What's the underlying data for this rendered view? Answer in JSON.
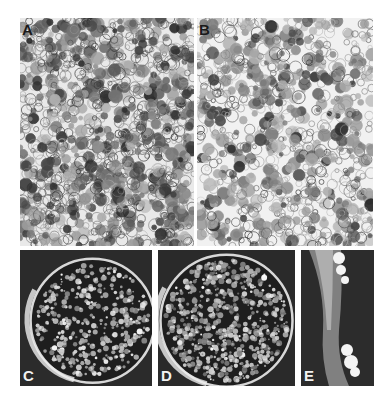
{
  "figure": {
    "panels": [
      {
        "id": "A",
        "label": "A",
        "description": "micrograph of dense cell suspension",
        "tone": "light"
      },
      {
        "id": "B",
        "label": "B",
        "description": "micrograph of sparser cell suspension",
        "tone": "light"
      },
      {
        "id": "C",
        "label": "C",
        "description": "petri dish with colonies",
        "tone": "dark"
      },
      {
        "id": "D",
        "label": "D",
        "description": "petri dish with dense colonies",
        "tone": "dark"
      },
      {
        "id": "E",
        "label": "E",
        "description": "tissue explant with callus",
        "tone": "dark"
      }
    ]
  }
}
